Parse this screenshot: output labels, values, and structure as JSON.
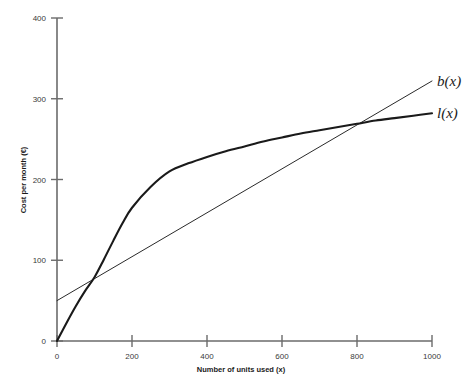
{
  "chart_data": {
    "type": "line",
    "title": "",
    "xlabel": "Number of units used (x)",
    "ylabel": "Cost per month (€)",
    "xlim": [
      0,
      1000
    ],
    "ylim": [
      0,
      400
    ],
    "xticks": [
      0,
      200,
      400,
      600,
      800,
      1000
    ],
    "yticks": [
      0,
      100,
      200,
      300,
      400
    ],
    "xtick_labels": [
      "0",
      "200",
      "400",
      "600",
      "800",
      "1000"
    ],
    "ytick_labels": [
      "0",
      "100",
      "200",
      "300",
      "400"
    ],
    "grid": false,
    "legend_position": "right-inline-labels",
    "series": [
      {
        "name": "l(x)",
        "label": "l(x)",
        "style": "thick-concave-curve",
        "color": "#1a1a1a",
        "x": [
          0,
          25,
          50,
          75,
          100,
          125,
          150,
          175,
          200,
          250,
          300,
          350,
          400,
          450,
          500,
          550,
          600,
          650,
          700,
          750,
          800,
          850,
          900,
          950,
          1000
        ],
        "y": [
          0,
          22,
          43,
          62,
          79,
          101,
          124,
          146,
          165,
          191,
          210,
          220,
          228,
          235,
          241,
          247,
          252,
          257,
          261,
          265,
          269,
          273,
          276,
          279,
          282
        ]
      },
      {
        "name": "b(x)",
        "label": "b(x)",
        "style": "thin-straight-line",
        "color": "#1a1a1a",
        "x": [
          0,
          1000
        ],
        "y": [
          50,
          322
        ]
      }
    ],
    "annotations": [
      {
        "text": "b(x)",
        "x": 1000,
        "y": 322,
        "placement": "right-of-endpoint"
      },
      {
        "text": "l(x)",
        "x": 1000,
        "y": 282,
        "placement": "right-of-endpoint"
      }
    ],
    "intersections": [
      {
        "x": 100,
        "y": 79
      },
      {
        "x": 800,
        "y": 269
      }
    ]
  },
  "axis": {
    "x_title": "Number of units used (x)",
    "y_title": "Cost per month (€)"
  },
  "colors": {
    "axis": "#6b6b6b",
    "curve": "#1a1a1a",
    "line": "#2a2a2a",
    "text": "#1a1a1a",
    "tick_text": "#3a3a3a",
    "background": "#ffffff"
  }
}
